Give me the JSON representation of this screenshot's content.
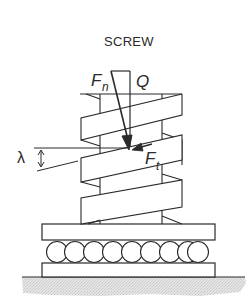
{
  "diagram": {
    "title": "SCREW",
    "labels": {
      "normal_force": {
        "symbol": "F",
        "subscript": "n"
      },
      "axial_load": {
        "symbol": "Q"
      },
      "tangential_force": {
        "symbol": "F",
        "subscript": "t"
      },
      "lead_angle": {
        "symbol": "λ"
      }
    },
    "components": [
      "force-triangle",
      "screw-thread",
      "load-plate",
      "roller-bearing",
      "base-plate",
      "ground"
    ],
    "roller_count": 9,
    "colors": {
      "line": "#2a2a2a",
      "ground_fill": "#dcdcdc",
      "background": "#ffffff"
    }
  }
}
